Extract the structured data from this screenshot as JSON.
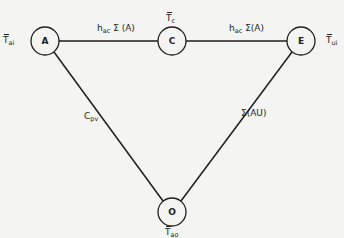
{
  "diagram": {
    "type": "network",
    "nodes": [
      {
        "id": "A",
        "label": "A",
        "cx": 45,
        "cy": 41,
        "r": 14
      },
      {
        "id": "C",
        "label": "C",
        "cx": 172,
        "cy": 41,
        "r": 14
      },
      {
        "id": "E",
        "label": "E",
        "cx": 301,
        "cy": 41,
        "r": 14
      },
      {
        "id": "O",
        "label": "O",
        "cx": 172,
        "cy": 212,
        "r": 14
      }
    ],
    "edges": [
      {
        "from": "A",
        "to": "C",
        "label_main": "h",
        "label_sub": "ac",
        "label_tail": " Σ (A)"
      },
      {
        "from": "C",
        "to": "E",
        "label_main": "h",
        "label_sub": "ac",
        "label_tail": " Σ(A)"
      },
      {
        "from": "A",
        "to": "O",
        "label_main": "C",
        "label_sub": "pv",
        "label_tail": ""
      },
      {
        "from": "E",
        "to": "O",
        "label_main": "Σ(AU)",
        "label_sub": "",
        "label_tail": ""
      }
    ],
    "node_temps": {
      "A": {
        "main": "T",
        "sub": "ai"
      },
      "C": {
        "main": "T",
        "sub": "c"
      },
      "E": {
        "main": "T",
        "sub": "ui"
      },
      "O": {
        "main": "T",
        "sub": "ao"
      }
    },
    "colors": {
      "ink": "#1e1e1e",
      "paper": "#f4f4f2"
    }
  }
}
